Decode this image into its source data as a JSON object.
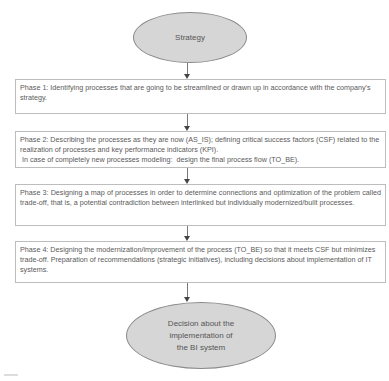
{
  "diagram": {
    "start": {
      "label": "Strategy"
    },
    "phases": [
      {
        "lines": [
          "Phase 1: Identifying processes that are going to be streamlined or drawn up in accordance with the company's strategy."
        ]
      },
      {
        "lines": [
          "Phase 2: Describing the processes as they are now (AS_IS); defining critical success factors (CSF) related to the realization of processes and key performance indicators (KPI).",
          " In case of completely new processes modeling:  design the final process flow (TO_BE)."
        ]
      },
      {
        "lines": [
          "Phase 3: Designing a map of processes in order to determine connections and optimization of the problem called trade-off, that is, a potential contradiction between interlinked but individually modernized/built processes."
        ]
      },
      {
        "lines": [
          "Phase 4: Designing the modernization/improvement of the process (TO_BE) so that it meets CSF but minimizes trade-off. Preparation of recommendations (strategic initiatives), including decisions about implementation of IT systems."
        ]
      }
    ],
    "end": {
      "label": "Decision about the implementation of the BI system"
    }
  }
}
